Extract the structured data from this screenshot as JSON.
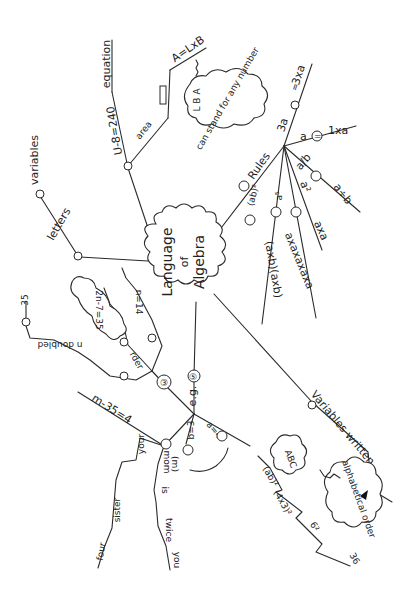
{
  "diagram": {
    "type": "mind-map",
    "style": "hand-drawn pencil sketch, rotated 90 degrees",
    "colors": {
      "ink": "#2a2a2a",
      "paper": "#ffffff"
    },
    "center": {
      "label_line1": "Language",
      "label_line2": "of",
      "label_line3": "Algebra"
    },
    "branches": {
      "b1_letters": {
        "marker": "①",
        "label": "letters",
        "sub": {
          "marker": "①",
          "label": "variables"
        }
      },
      "b2_equation": {
        "marker": "②",
        "formula": "U-8=240",
        "end_label": "equation",
        "area": {
          "label": "area",
          "shape": "rectangle",
          "formula": "A=LxB",
          "cloud_letters": "L B A",
          "cloud_text": "can stand for any number"
        }
      },
      "b3_rules": {
        "marker": "③",
        "label": "Rules",
        "items": [
          {
            "left": "3a",
            "eq": "=",
            "right": "3xa"
          },
          {
            "left": "a",
            "eq": "=",
            "right": "1xa"
          },
          {
            "left": "a/b",
            "eq": "=",
            "right": "a÷b"
          },
          {
            "left": "a²",
            "eq": "=",
            "right": "axa"
          },
          {
            "left": "a⁵",
            "eq": "=",
            "right": "axaxaxaxa"
          },
          {
            "left": "(ab)²",
            "eq": "=",
            "right": "(axb)(axb)"
          }
        ]
      },
      "b4_variables_written": {
        "marker": "④",
        "label": "Variables written",
        "cloud_text": "alphabetical order",
        "example_cloud": "ABC"
      },
      "b5": {
        "marker": "⑤",
        "label": "e.g.",
        "sub_a": {
          "marker": "⑥",
          "label": "a=4",
          "chain": [
            "(ab)²",
            "(4x3)²",
            "6²",
            "36"
          ]
        },
        "sub_b": {
          "marker": "⑥",
          "label": "b=3"
        },
        "sub_c": {
          "marker": "⑥",
          "formula": "m-35=4",
          "chain_1": [
            "mom",
            "(m)",
            "is",
            "twice",
            "you"
          ],
          "chain_2": [
            "your",
            "sister",
            "four"
          ]
        },
        "sub_d": {
          "marker": "③",
          "chain_1": [
            "a",
            "②",
            "n doubled",
            "is",
            "②",
            "35"
          ],
          "chain_2": [
            "rder",
            "②",
            "2n-7=35"
          ],
          "chain_3": [
            "⑪",
            ":",
            "n=14"
          ]
        }
      }
    }
  }
}
